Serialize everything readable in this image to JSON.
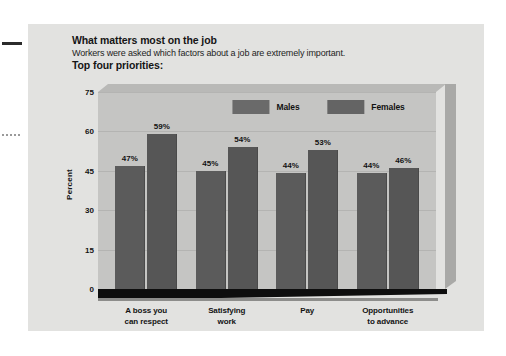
{
  "heading": {
    "title": "What matters most on the job",
    "subtitle": "Workers were asked which factors about a job are extremely important.",
    "kicker": "Top four priorities:"
  },
  "chart_data": {
    "type": "bar",
    "title": "What matters most on the job",
    "subtitle": "Workers were asked which factors about a job are extremely important.",
    "xlabel": "",
    "ylabel": "Percent",
    "ylim": [
      0,
      75
    ],
    "yticks": [
      0,
      15,
      30,
      45,
      60,
      75
    ],
    "grid": true,
    "legend_position": "top",
    "value_suffix": "%",
    "categories": [
      "A boss you can respect",
      "Satisfying work",
      "Pay",
      "Opportunities to advance"
    ],
    "category_lines": [
      [
        "A boss you",
        "can respect"
      ],
      [
        "Satisfying",
        "work"
      ],
      [
        "Pay",
        ""
      ],
      [
        "Opportunities",
        "to advance"
      ]
    ],
    "series": [
      {
        "name": "Males",
        "color": "#5b5b5b",
        "values": [
          47,
          45,
          44,
          44
        ],
        "labels": [
          "47%",
          "45%",
          "44%",
          "44%"
        ]
      },
      {
        "name": "Females",
        "color": "#565656",
        "values": [
          59,
          54,
          53,
          46
        ],
        "labels": [
          "59%",
          "54%",
          "53%",
          "46%"
        ]
      }
    ]
  },
  "colors": {
    "card_background": "#e2e2e0",
    "plot_background": "#c5c5c3",
    "plot_top_face": "#b9b9b7",
    "plot_side_face": "#a9a9a7",
    "floor": "#0e0e0e",
    "gridline": "#b4b4b2",
    "text": "#131313"
  }
}
